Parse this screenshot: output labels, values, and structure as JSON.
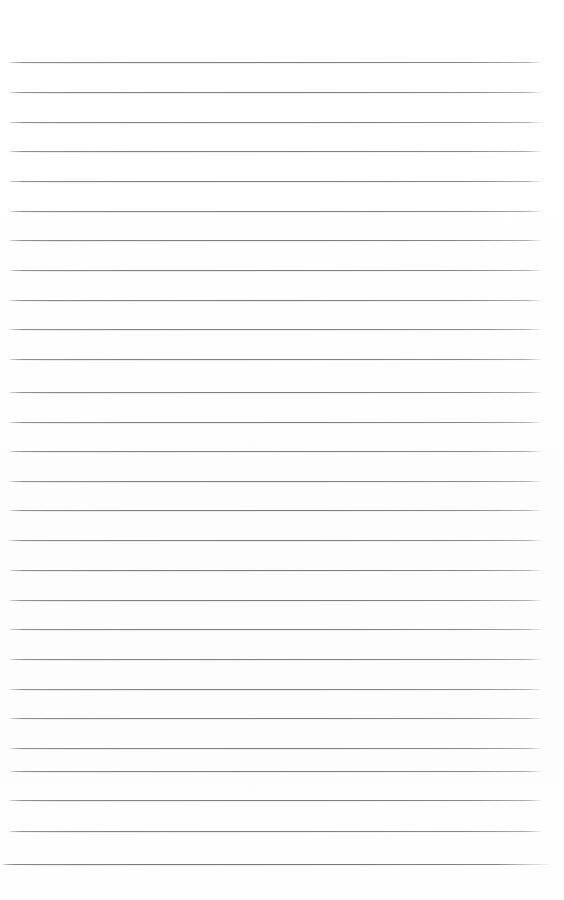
{
  "document": {
    "kind": "scanned-lined-paper",
    "description": "Blank ruled notebook page, no handwriting or printed text",
    "page_width": 564,
    "page_height": 900,
    "background_color": "#ffffff",
    "paper_tint": "#fefefe",
    "has_margin_rule": false,
    "has_holes": false,
    "text_content": ""
  },
  "ruling": {
    "line_color": "#8a8a8a",
    "line_thickness_px": 1,
    "line_count": 28,
    "first_line_y": 62,
    "line_spacing_px": 29.6,
    "line_left_x": 8,
    "line_right_x": 543,
    "bottom_line_left_x": 2,
    "bottom_line_right_x": 552,
    "lines": [
      {
        "index": 1,
        "y": 62,
        "left": 8,
        "right": 543
      },
      {
        "index": 2,
        "y": 92,
        "left": 8,
        "right": 543
      },
      {
        "index": 3,
        "y": 122,
        "left": 8,
        "right": 543
      },
      {
        "index": 4,
        "y": 151,
        "left": 8,
        "right": 543
      },
      {
        "index": 5,
        "y": 181,
        "left": 8,
        "right": 543
      },
      {
        "index": 6,
        "y": 211,
        "left": 8,
        "right": 543
      },
      {
        "index": 7,
        "y": 240,
        "left": 8,
        "right": 543
      },
      {
        "index": 8,
        "y": 270,
        "left": 8,
        "right": 543
      },
      {
        "index": 9,
        "y": 300,
        "left": 8,
        "right": 543
      },
      {
        "index": 10,
        "y": 329,
        "left": 8,
        "right": 543
      },
      {
        "index": 11,
        "y": 359,
        "left": 8,
        "right": 543
      },
      {
        "index": 12,
        "y": 392,
        "left": 8,
        "right": 543
      },
      {
        "index": 13,
        "y": 422,
        "left": 8,
        "right": 543
      },
      {
        "index": 14,
        "y": 451,
        "left": 8,
        "right": 543
      },
      {
        "index": 15,
        "y": 481,
        "left": 8,
        "right": 543
      },
      {
        "index": 16,
        "y": 510,
        "left": 8,
        "right": 543
      },
      {
        "index": 17,
        "y": 540,
        "left": 8,
        "right": 543
      },
      {
        "index": 18,
        "y": 570,
        "left": 8,
        "right": 543
      },
      {
        "index": 19,
        "y": 600,
        "left": 8,
        "right": 543
      },
      {
        "index": 20,
        "y": 629,
        "left": 8,
        "right": 543
      },
      {
        "index": 21,
        "y": 659,
        "left": 8,
        "right": 543
      },
      {
        "index": 22,
        "y": 689,
        "left": 8,
        "right": 543
      },
      {
        "index": 23,
        "y": 718,
        "left": 8,
        "right": 543
      },
      {
        "index": 24,
        "y": 748,
        "left": 8,
        "right": 543
      },
      {
        "index": 25,
        "y": 771,
        "left": 8,
        "right": 543
      },
      {
        "index": 26,
        "y": 800,
        "left": 8,
        "right": 543
      },
      {
        "index": 27,
        "y": 831,
        "left": 8,
        "right": 543
      },
      {
        "index": 28,
        "y": 864,
        "left": 2,
        "right": 552
      }
    ]
  }
}
